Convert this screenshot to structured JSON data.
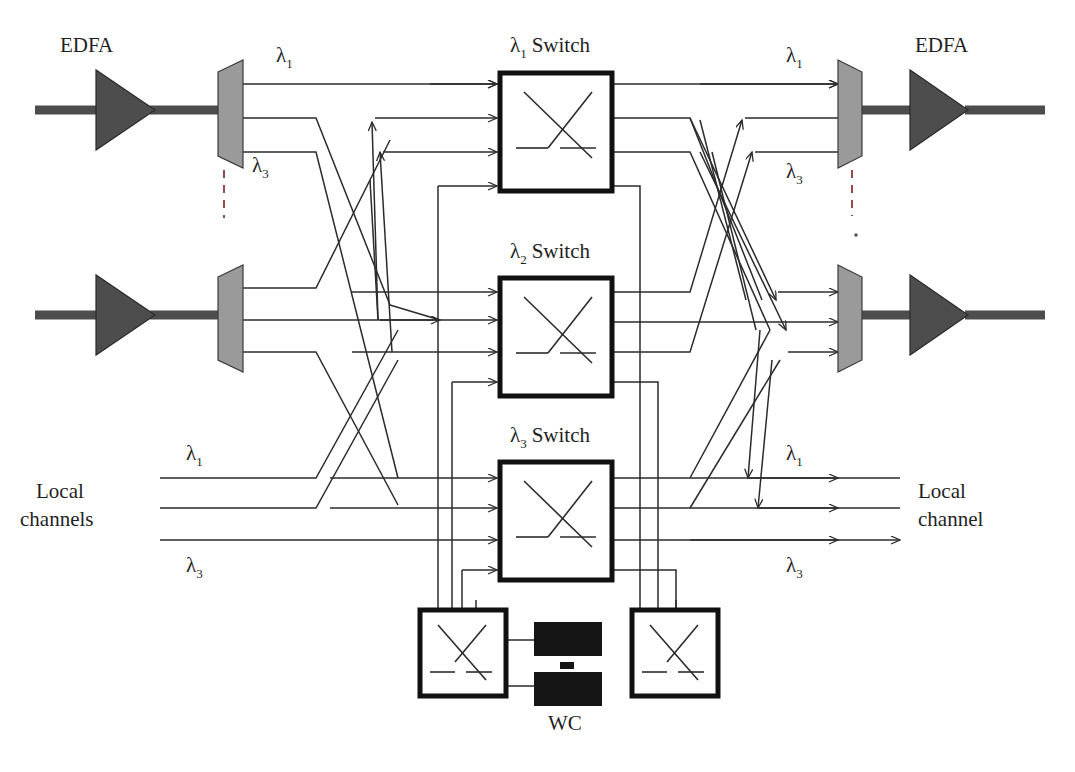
{
  "diagram": {
    "colors": {
      "amplifier_fill": "#4d4d4d",
      "mux_fill": "#9a9a9a",
      "line": "#2b2b2b",
      "box_border": "#111111",
      "wc_fill": "#151515",
      "background": "#ffffff"
    },
    "labels": {
      "edfa_left_top": "EDFA",
      "edfa_right_top": "EDFA",
      "lambda1_in_top": "λ",
      "lambda1_in_top_sub": "1",
      "lambda3_in_top": "λ",
      "lambda3_in_top_sub": "3",
      "lambda1_out_top": "λ",
      "lambda1_out_top_sub": "1",
      "lambda3_out_top": "λ",
      "lambda3_out_top_sub": "3",
      "lambda1_local_in": "λ",
      "lambda1_local_in_sub": "1",
      "lambda3_local_in": "λ",
      "lambda3_local_in_sub": "3",
      "lambda1_local_out": "λ",
      "lambda1_local_out_sub": "1",
      "lambda3_local_out": "λ",
      "lambda3_local_out_sub": "3",
      "local_channels_in_line1": "Local",
      "local_channels_in_line2": "channels",
      "local_channel_out_line1": "Local",
      "local_channel_out_line2": "channel",
      "wc_label": "WC"
    },
    "switches": [
      {
        "name": "lambda1-switch",
        "symbol": "λ",
        "sub": "1",
        "word": "Switch"
      },
      {
        "name": "lambda2-switch",
        "symbol": "λ",
        "sub": "2",
        "word": "Switch"
      },
      {
        "name": "lambda3-switch",
        "symbol": "λ",
        "sub": "3",
        "word": "Switch"
      }
    ],
    "wavelength_converters": {
      "count_shown": 2,
      "ellipsis": "⋮",
      "left_switch_name": "wc-input-switch",
      "right_switch_name": "wc-output-switch"
    },
    "fibers": {
      "input_fiber_count": 2,
      "output_fiber_count": 2,
      "wavelengths_per_fiber": 3,
      "local_add_ports": 3,
      "local_drop_ports": 3
    }
  }
}
